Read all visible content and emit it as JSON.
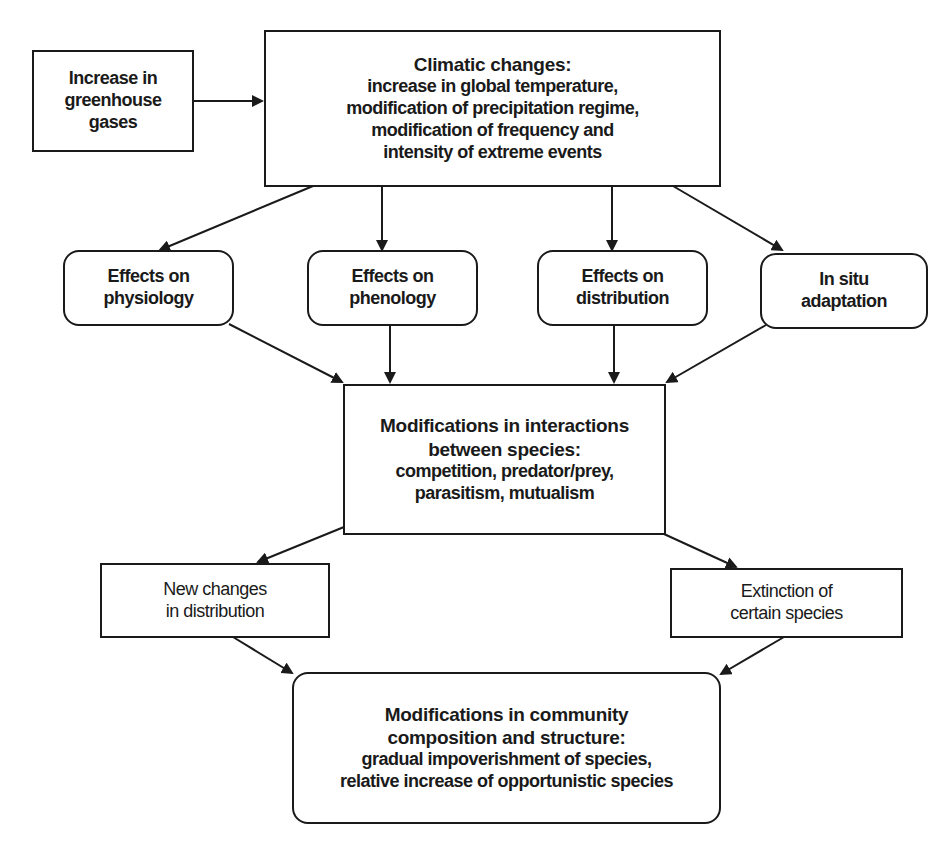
{
  "diagram": {
    "type": "flowchart",
    "nodes": {
      "greenhouse": {
        "lines": [
          "Increase in",
          "greenhouse",
          "gases"
        ]
      },
      "climatic": {
        "title": "Climatic changes:",
        "lines": [
          "increase in global temperature,",
          "modification of precipitation regime,",
          "modification of frequency and",
          "intensity of extreme events"
        ]
      },
      "physiology": {
        "lines": [
          "Effects on",
          "physiology"
        ]
      },
      "phenology": {
        "lines": [
          "Effects on",
          "phenology"
        ]
      },
      "distribution": {
        "lines": [
          "Effects on",
          "distribution"
        ]
      },
      "adaptation": {
        "lines": [
          "In situ",
          "adaptation"
        ]
      },
      "interactions": {
        "title_lines": [
          "Modifications in interactions",
          "between species:"
        ],
        "lines": [
          "competition, predator/prey,",
          "parasitism, mutualism"
        ]
      },
      "new_changes": {
        "lines": [
          "New changes",
          "in distribution"
        ]
      },
      "extinction": {
        "lines": [
          "Extinction of",
          "certain species"
        ]
      },
      "community": {
        "title_lines": [
          "Modifications in community",
          "composition and structure:"
        ],
        "lines": [
          "gradual impoverishment of species,",
          "relative increase of opportunistic species"
        ]
      }
    },
    "edges": [
      [
        "greenhouse",
        "climatic"
      ],
      [
        "climatic",
        "physiology"
      ],
      [
        "climatic",
        "phenology"
      ],
      [
        "climatic",
        "distribution"
      ],
      [
        "climatic",
        "adaptation"
      ],
      [
        "physiology",
        "interactions"
      ],
      [
        "phenology",
        "interactions"
      ],
      [
        "distribution",
        "interactions"
      ],
      [
        "adaptation",
        "interactions"
      ],
      [
        "interactions",
        "new_changes"
      ],
      [
        "interactions",
        "extinction"
      ],
      [
        "new_changes",
        "community"
      ],
      [
        "extinction",
        "community"
      ]
    ],
    "colors": {
      "stroke": "#1a1a1a",
      "background": "#ffffff"
    }
  }
}
